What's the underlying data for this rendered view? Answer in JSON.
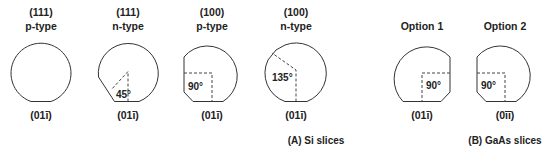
{
  "figure": {
    "group_a": {
      "caption": "(A) Si slices",
      "wafers": [
        {
          "orientation": "(111)",
          "type": "p-type",
          "flat_label": "(01ī)",
          "angle": ""
        },
        {
          "orientation": "(111)",
          "type": "n-type",
          "flat_label": "(01ī)",
          "angle": "45°"
        },
        {
          "orientation": "(100)",
          "type": "p-type",
          "flat_label": "(01ī)",
          "angle": "90°"
        },
        {
          "orientation": "(100)",
          "type": "n-type",
          "flat_label": "(01ī)",
          "angle": "135°"
        }
      ]
    },
    "group_b": {
      "caption": "(B) GaAs slices",
      "wafers": [
        {
          "title": "Option 1",
          "flat_label": "(01ī)",
          "angle": "90°"
        },
        {
          "title": "Option 2",
          "flat_label": "(0īī)",
          "angle": "90°"
        }
      ]
    }
  }
}
